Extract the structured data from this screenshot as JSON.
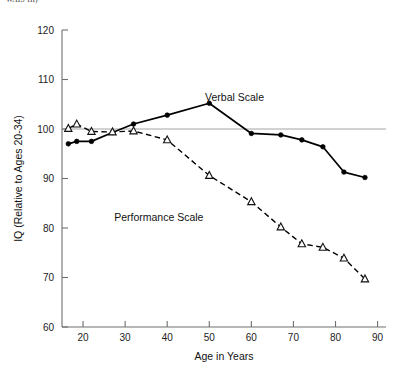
{
  "figure": {
    "clipped_top_caption": "WAIS-III)",
    "width": 398,
    "height": 372
  },
  "chart_data": {
    "type": "line",
    "title": "",
    "xlabel": "Age in Years",
    "ylabel": "IQ (Relative to Ages 20-34)",
    "xlim": [
      15,
      92
    ],
    "ylim": [
      60,
      120
    ],
    "xticks": [
      20,
      30,
      40,
      50,
      60,
      70,
      80,
      90
    ],
    "xtick_labels": [
      "20",
      "30",
      "40",
      "50",
      "60",
      "70",
      "80",
      "90"
    ],
    "yticks": [
      60,
      70,
      80,
      90,
      100,
      110,
      120
    ],
    "ytick_labels": [
      "60",
      "70",
      "80",
      "90",
      "100",
      "110",
      "120"
    ],
    "grid": false,
    "reference_line": {
      "y": 100,
      "color": "#9a9a9a",
      "label": ""
    },
    "legend_position": "inline-annotations",
    "series": [
      {
        "name": "Verbal Scale",
        "marker": "filled-circle",
        "linestyle": "solid",
        "color": "#000000",
        "label_x": 56,
        "label_y": 105.6,
        "x": [
          16.5,
          18.5,
          22,
          27,
          32,
          40,
          50,
          60,
          67,
          72,
          77,
          82,
          87
        ],
        "y": [
          97.0,
          97.5,
          97.5,
          99.3,
          101.0,
          102.8,
          105.2,
          99.1,
          98.8,
          97.8,
          96.4,
          91.3,
          90.2
        ]
      },
      {
        "name": "Performance Scale",
        "marker": "open-triangle",
        "linestyle": "dashed",
        "color": "#000000",
        "label_x": 38,
        "label_y": 81.5,
        "x": [
          16.5,
          18.5,
          22,
          27,
          32,
          40,
          50,
          60,
          67,
          72,
          77,
          82,
          87
        ],
        "y": [
          100.1,
          101.0,
          99.5,
          99.4,
          99.6,
          97.8,
          90.6,
          85.3,
          80.2,
          76.8,
          76.1,
          73.9,
          69.7
        ]
      }
    ]
  }
}
